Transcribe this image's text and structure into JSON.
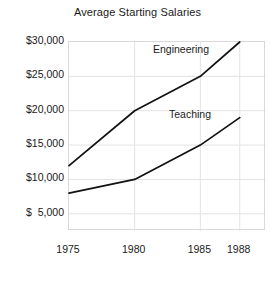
{
  "chart_data": {
    "type": "line",
    "title": "Average Starting Salaries",
    "xlabel": "",
    "ylabel": "",
    "x": [
      1975,
      1980,
      1985,
      1988
    ],
    "categories": [
      "1975",
      "1980",
      "1985",
      "1988"
    ],
    "xtick_labels": [
      "1975",
      "1980",
      "1985",
      "1988"
    ],
    "ytick_labels": [
      "$30,000",
      "$25,000",
      "$20,000",
      "$15,000",
      "$10,000",
      "$  5,000"
    ],
    "ytick_values": [
      30000,
      25000,
      20000,
      15000,
      10000,
      5000
    ],
    "xlim": [
      1975,
      1990
    ],
    "ylim": [
      2500,
      30000
    ],
    "grid": true,
    "legend_position": "inline-annotation",
    "series": [
      {
        "name": "Engineering",
        "values": [
          12000,
          20000,
          25000,
          30000
        ],
        "color": "#111111"
      },
      {
        "name": "Teaching",
        "values": [
          8000,
          10000,
          15000,
          19000
        ],
        "color": "#111111"
      }
    ],
    "annotations": [
      {
        "text": "Engineering",
        "near_x": 1981,
        "near_y": 28000
      },
      {
        "text": "Teaching",
        "near_x": 1984,
        "near_y": 20500
      }
    ],
    "colors": {
      "background": "#ffffff",
      "grid": "#e3e3e3",
      "frame": "#d9d9d9",
      "text": "#1a1a1a",
      "line": "#111111"
    }
  }
}
